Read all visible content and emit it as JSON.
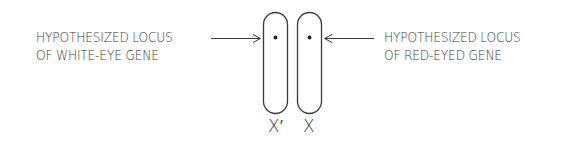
{
  "diagram": {
    "left_annotation": {
      "line1": "HYPOTHESIZED LOCUS",
      "line2": "OF WHITE-EYE GENE"
    },
    "right_annotation": {
      "line1": "HYPOTHESIZED LOCUS",
      "line2": "OF RED-EYED GENE"
    },
    "chromosomes": [
      {
        "label": "X′",
        "has_locus_dot": true
      },
      {
        "label": "X",
        "has_locus_dot": true
      }
    ],
    "colors": {
      "ink": "#3a3a3a",
      "background": "#ffffff"
    }
  }
}
